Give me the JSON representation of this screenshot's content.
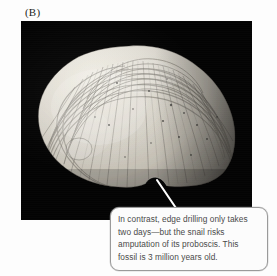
{
  "figure": {
    "panel_label": "(B)",
    "caption_text": "In contrast, edge drilling only takes\ntwo days—but the snail risks\namputation of its proboscis. This\nfossil is 3 million years old.",
    "caption_lines": [
      "In contrast, edge drilling only takes",
      "two days—but the snail risks",
      "amputation of its proboscis. This",
      "fossil is 3 million years old."
    ],
    "photo": {
      "subject": "fossil bivalve clam shell with edge drill notch",
      "background_color": "#030303",
      "shell_light_color": "#e6e3da",
      "shell_mid_color": "#b3aea4",
      "shell_shadow_color": "#5d5a54"
    },
    "pointer": {
      "color": "#ffffff",
      "from_label": "callout-bubble-top",
      "to_label": "shell-edge-notch"
    },
    "colors": {
      "page_background": "#fdfdfd",
      "callout_border": "#9a9a9a",
      "callout_fill": "#fcfcfc",
      "caption_text": "#4a4a4a",
      "panel_label_text": "#231f20"
    }
  }
}
